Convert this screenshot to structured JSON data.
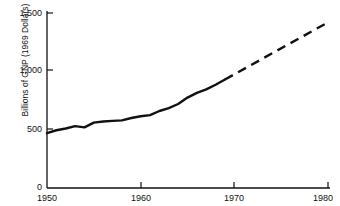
{
  "chart_data": {
    "type": "line",
    "title": "",
    "subtitle": "",
    "xlabel": "",
    "ylabel": "Billions of GNP (1969 Dollars)",
    "xlim": [
      1950,
      1980
    ],
    "ylim": [
      0,
      1500
    ],
    "grid": false,
    "legend": "none",
    "y_ticks": [
      {
        "value": 1500,
        "label": "1,500"
      },
      {
        "value": 1000,
        "label": "1,000"
      },
      {
        "value": 500,
        "label": "500"
      },
      {
        "value": 0,
        "label": "0"
      }
    ],
    "x_ticks": [
      {
        "value": 1950,
        "label": "1950"
      },
      {
        "value": 1960,
        "label": "1960"
      },
      {
        "value": 1970,
        "label": "1970"
      },
      {
        "value": 1980,
        "label": "1980"
      }
    ],
    "series": [
      {
        "name": "GNP actual",
        "style": "solid",
        "color": "#111111",
        "x": [
          1950,
          1951,
          1952,
          1953,
          1954,
          1955,
          1956,
          1957,
          1958,
          1959,
          1960,
          1961,
          1962,
          1963,
          1964,
          1965,
          1966,
          1967,
          1968,
          1969
        ],
        "values": [
          470,
          495,
          510,
          530,
          520,
          560,
          570,
          575,
          580,
          600,
          615,
          625,
          660,
          685,
          720,
          775,
          815,
          845,
          885,
          930
        ]
      },
      {
        "name": "GNP projected",
        "style": "dashed",
        "color": "#111111",
        "x": [
          1969,
          1980
        ],
        "values": [
          930,
          1420
        ]
      }
    ],
    "annotations": []
  },
  "axis": {
    "y_axis_title": "Billions of GNP (1969 Dollars)"
  }
}
